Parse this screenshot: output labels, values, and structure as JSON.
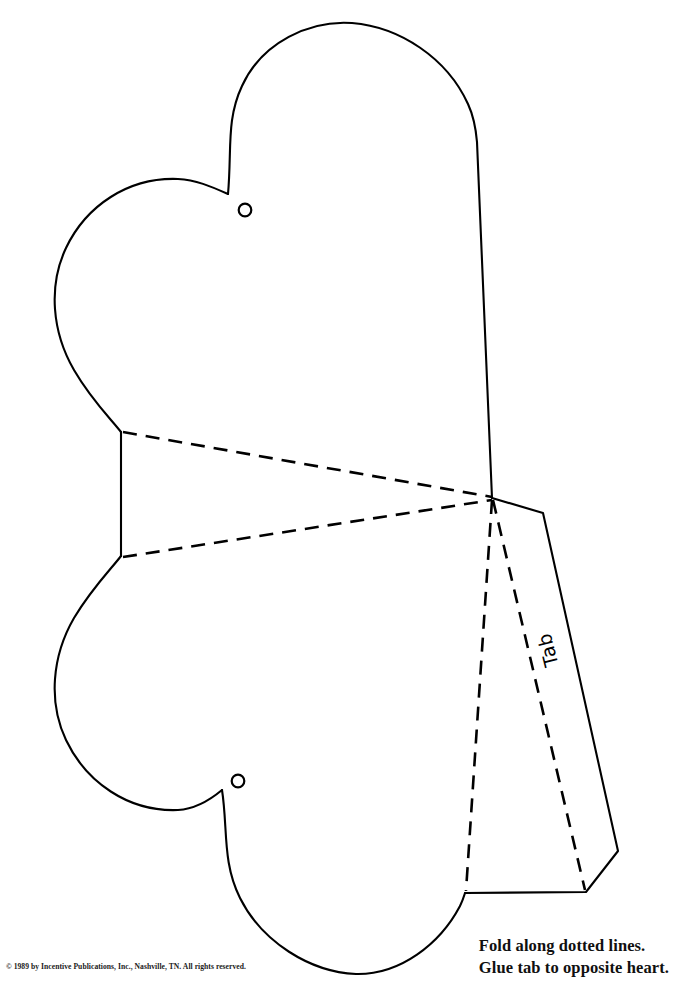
{
  "page": {
    "background_color": "#ffffff",
    "ink_color": "#000000",
    "width": 677,
    "height": 996
  },
  "template": {
    "tab_label": "Tab",
    "hole_count": 2,
    "heart_count": 2
  },
  "instructions": {
    "line1": "Fold along dotted lines.",
    "line2": "Glue tab to opposite heart."
  },
  "footer": {
    "copyright": "© 1989 by Incentive Publications, Inc., Nashville, TN. All rights reserved."
  }
}
